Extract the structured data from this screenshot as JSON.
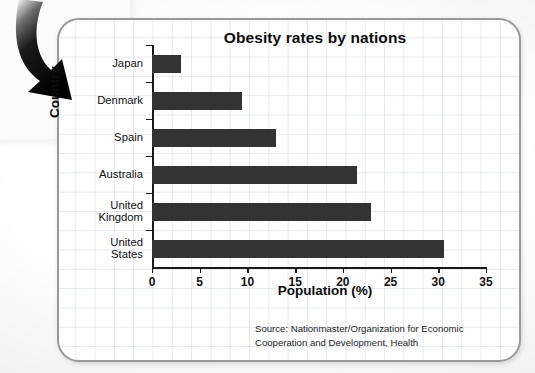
{
  "chart_data": {
    "type": "bar",
    "orientation": "horizontal",
    "title": "Obesity rates by nations",
    "xlabel": "Population (%)",
    "ylabel": "Country",
    "categories": [
      "Japan",
      "Denmark",
      "Spain",
      "Australia",
      "United\nKingdom",
      "United\nStates"
    ],
    "values": [
      3.0,
      9.4,
      13.0,
      21.5,
      23.0,
      30.6
    ],
    "xlim": [
      0,
      35
    ],
    "xticks": [
      0,
      5,
      10,
      15,
      20,
      25,
      30,
      35
    ],
    "xtick_labels": [
      "0",
      "5",
      "10",
      "15",
      "20",
      "25",
      "30",
      "35"
    ],
    "grid": true,
    "legend": null,
    "bar_color": "#333333",
    "axis_color": "#1a1a1a",
    "grid_color": "#aabacd",
    "annotations": {
      "source": "Source: Nationmaster/Organization for Economic\nCooperation and Development, Health"
    }
  },
  "decor": {
    "arrow_label": "down-right-curved-arrow",
    "card_border_color": "#9a9a9a",
    "page_background": "#f2f2f2"
  }
}
